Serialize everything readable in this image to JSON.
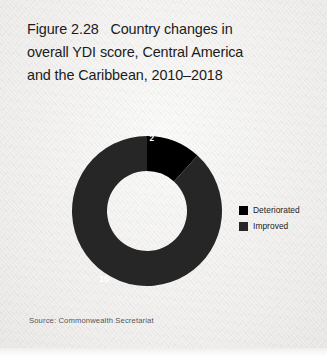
{
  "figure": {
    "title_lines": [
      "Figure 2.28   Country changes in",
      "overall YDI score, Central America",
      "and the Caribbean, 2010–2018"
    ],
    "source": "Source: Commonwealth Secretariat"
  },
  "legend": {
    "position": "right",
    "items": [
      {
        "label": "Deteriorated",
        "color": "#000000"
      },
      {
        "label": "Improved",
        "color": "#262626"
      }
    ]
  },
  "chart_data": {
    "type": "pie",
    "variant": "donut",
    "title": "Figure 2.28   Country changes in overall YDI score, Central America and the Caribbean, 2010–2018",
    "xlabel": "",
    "ylabel": "",
    "categories": [
      "Deteriorated",
      "Improved"
    ],
    "values": [
      2,
      15
    ],
    "total": 17,
    "data_labels": [
      "2",
      "15"
    ],
    "colors": [
      "#000000",
      "#262626"
    ],
    "label_color": "#ffffff",
    "start_angle_deg": 0,
    "direction": "clockwise",
    "inner_radius_ratio": 0.53,
    "grid": false,
    "legend_position": "right",
    "geometry": {
      "center_x": 147,
      "center_y": 107,
      "outer_radius": 75,
      "inner_radius": 40
    }
  }
}
